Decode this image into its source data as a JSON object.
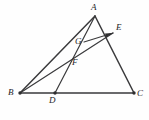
{
  "figure": {
    "background_color": "#fefefe",
    "stroke_color": "#3a3a3c",
    "label_color": "#1d1d1f",
    "width": 149,
    "height": 120
  },
  "points": {
    "A": {
      "label": "A",
      "x": 95,
      "y": 16,
      "label_x": 91,
      "label_y": 3
    },
    "B": {
      "label": "B",
      "x": 20,
      "y": 93,
      "label_x": 8,
      "label_y": 88
    },
    "C": {
      "label": "C",
      "x": 134,
      "y": 93,
      "label_x": 137,
      "label_y": 89
    },
    "D": {
      "label": "D",
      "x": 55,
      "y": 93,
      "label_x": 49,
      "label_y": 96
    },
    "E": {
      "label": "E",
      "x": 113,
      "y": 33,
      "label_x": 116,
      "label_y": 23
    },
    "F": {
      "label": "F",
      "x": 78,
      "y": 57,
      "label_x": 72,
      "label_y": 58
    },
    "G": {
      "label": "G",
      "x": 84,
      "y": 42,
      "label_x": 75,
      "label_y": 37
    }
  },
  "segments": [
    {
      "name": "side-AB",
      "from": "A",
      "to": "B",
      "weight": "main"
    },
    {
      "name": "side-AC",
      "from": "A",
      "to": "C",
      "weight": "main"
    },
    {
      "name": "side-BC",
      "from": "B",
      "to": "C",
      "weight": "main"
    },
    {
      "name": "cevian-AD",
      "from": "A",
      "to": "D",
      "weight": "thin"
    },
    {
      "name": "cevian-BE",
      "from": "B",
      "to": "E",
      "weight": "thin"
    },
    {
      "name": "segment-GE",
      "from": "G",
      "to": "E",
      "weight": "seg"
    }
  ],
  "arrows": [
    {
      "name": "arrow-G-to-E",
      "from": "G",
      "to": "E"
    }
  ],
  "vertex_dots": [
    "B",
    "C",
    "D"
  ]
}
